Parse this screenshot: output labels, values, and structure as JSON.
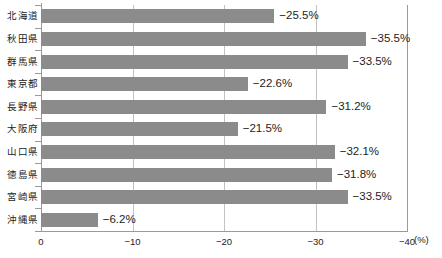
{
  "chart_data": {
    "type": "bar",
    "orientation": "horizontal",
    "title": "",
    "subtitle": "",
    "xlabel": "(%)",
    "ylabel": "",
    "unit": "(%)",
    "categories": [
      "北海道",
      "秋田県",
      "群馬県",
      "東京都",
      "長野県",
      "大阪府",
      "山口県",
      "徳島県",
      "宮崎県",
      "沖縄県"
    ],
    "values": [
      -25.5,
      -35.5,
      -33.5,
      -22.6,
      -31.2,
      -21.5,
      -32.1,
      -31.8,
      -33.5,
      -6.2
    ],
    "data_labels": [
      "−25.5%",
      "−35.5%",
      "−33.5%",
      "−22.6%",
      "−31.2%",
      "−21.5%",
      "−32.1%",
      "−31.8%",
      "−33.5%",
      "−6.2%"
    ],
    "xlim": [
      0,
      -40
    ],
    "xticks": [
      0,
      -10,
      -20,
      -30,
      -40
    ],
    "xtick_labels": [
      "0",
      "−10",
      "−20",
      "−30",
      "−40"
    ],
    "grid": true,
    "grid_axis": "x",
    "legend": "none",
    "bar_color": "#8b8b8b",
    "grid_color": "#c2c2c2",
    "axis_color": "#9a9a9a",
    "background": "#ffffff"
  }
}
